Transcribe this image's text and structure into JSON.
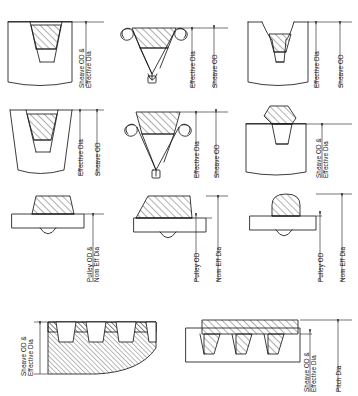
{
  "document": {
    "title": "Belt and Sheave Diameter Reference Diagram",
    "subject": "V-belt, cogged belt, flat belt and synchronous belt cross sections with diameter nomenclature",
    "background_color": "#ffffff",
    "ink_color": "#1a1a1a"
  },
  "labels": {
    "sheave_od_and_effective_dia": [
      "Sheave OD &",
      "Effective Dia"
    ],
    "effective_dia": "Effective Dia",
    "sheave_od": "Sheave OD",
    "pulley_od_and_nom_eff_dia": [
      "Pulley OD &",
      "Nom Eff Dia"
    ],
    "pulley_od": "Pulley OD",
    "nom_eff_dia": "Nom Eff Dia",
    "pitch_dia": "Pitch Dia"
  },
  "panels": [
    {
      "id": "r1c1",
      "row": 1,
      "column": 1,
      "belt_type": "classical-v-belt-in-grooved-sheave",
      "sheave_profile": "straight-sided-groove",
      "dimensions": [
        {
          "name": "Sheave OD & Effective Dia",
          "lines": [
            "Sheave OD &",
            "Effective Dia"
          ],
          "coincident": true
        }
      ]
    },
    {
      "id": "r1c2",
      "row": 1,
      "column": 2,
      "belt_type": "v-belt-on-double-hook-idler",
      "sheave_profile": "curled-flange-idler",
      "dimensions": [
        {
          "name": "Effective Dia",
          "lines": [
            "Effective Dia"
          ],
          "coincident": false
        },
        {
          "name": "Sheave OD",
          "lines": [
            "Sheave OD"
          ],
          "coincident": false
        }
      ]
    },
    {
      "id": "r1c3",
      "row": 1,
      "column": 3,
      "belt_type": "v-belt-in-deep-groove-sheave",
      "sheave_profile": "concave-shoulder-groove",
      "dimensions": [
        {
          "name": "Effective Dia",
          "lines": [
            "Effective Dia"
          ],
          "coincident": false
        },
        {
          "name": "Sheave OD",
          "lines": [
            "Sheave OD"
          ],
          "coincident": false
        }
      ]
    },
    {
      "id": "r2c1",
      "row": 2,
      "column": 1,
      "belt_type": "v-belt-in-flared-groove-sheave",
      "sheave_profile": "flared-straight-groove",
      "dimensions": [
        {
          "name": "Effective Dia",
          "lines": [
            "Effective Dia"
          ],
          "coincident": false
        },
        {
          "name": "Sheave OD",
          "lines": [
            "Sheave OD"
          ],
          "coincident": false
        }
      ]
    },
    {
      "id": "r2c2",
      "row": 2,
      "column": 2,
      "belt_type": "v-belt-on-double-hook-idler-raised",
      "sheave_profile": "curled-flange-idler",
      "dimensions": [
        {
          "name": "Effective Dia",
          "lines": [
            "Effective Dia"
          ],
          "coincident": false
        },
        {
          "name": "Sheave OD",
          "lines": [
            "Sheave OD"
          ],
          "coincident": false
        }
      ]
    },
    {
      "id": "r2c3",
      "row": 2,
      "column": 3,
      "belt_type": "v-belt-on-flat-pulley",
      "sheave_profile": "flat-face",
      "dimensions": [
        {
          "name": "Sheave OD & Effective Dia",
          "lines": [
            "Sheave OD &",
            "Effective Dia"
          ],
          "coincident": true
        }
      ]
    },
    {
      "id": "r3c1",
      "row": 3,
      "column": 1,
      "belt_type": "v-belt-on-flat-pulley-flush",
      "sheave_profile": "flat-face-with-crown-relief",
      "dimensions": [
        {
          "name": "Pulley OD & Nom Eff Dia",
          "lines": [
            "Pulley OD &",
            "Nom Eff Dia"
          ],
          "coincident": true
        }
      ]
    },
    {
      "id": "r3c2",
      "row": 3,
      "column": 2,
      "belt_type": "v-belt-riding-high-on-flat-pulley",
      "sheave_profile": "flat-face-with-crown-relief",
      "dimensions": [
        {
          "name": "Pulley OD",
          "lines": [
            "Pulley OD"
          ],
          "coincident": false
        },
        {
          "name": "Nom Eff Dia",
          "lines": [
            "Nom Eff Dia"
          ],
          "coincident": false
        }
      ]
    },
    {
      "id": "r3c3",
      "row": 3,
      "column": 3,
      "belt_type": "round-belt-on-flat-pulley",
      "sheave_profile": "flat-face-with-crown-relief",
      "dimensions": [
        {
          "name": "Pulley OD",
          "lines": [
            "Pulley OD"
          ],
          "coincident": false
        },
        {
          "name": "Nom Eff Dia",
          "lines": [
            "Nom Eff Dia"
          ],
          "coincident": false
        }
      ]
    },
    {
      "id": "r4c1",
      "row": 4,
      "column": 1,
      "belt_type": "multi-tooth-synchronous-belt-on-curved-pulley",
      "sheave_profile": "toothed-curved-body",
      "tooth_count": 4,
      "label_side": "left",
      "dimensions": [
        {
          "name": "Sheave OD & Effective Dia",
          "lines": [
            "Sheave OD &",
            "Effective Dia"
          ],
          "coincident": true
        }
      ]
    },
    {
      "id": "r4c2",
      "row": 4,
      "column": 2,
      "belt_type": "synchronous-belt-on-toothed-pulley",
      "sheave_profile": "toothed-flat-body",
      "tooth_count": 3,
      "label_side": "right",
      "dimensions": [
        {
          "name": "Sheave OD & Effective Dia",
          "lines": [
            "Sheave OD &",
            "Effective Dia"
          ],
          "coincident": true
        },
        {
          "name": "Pitch Dia",
          "lines": [
            "Pitch Dia"
          ],
          "coincident": false
        }
      ]
    }
  ]
}
